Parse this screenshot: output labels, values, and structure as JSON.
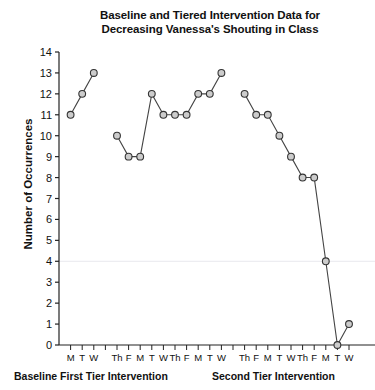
{
  "chart_data": {
    "type": "line",
    "title": "Baseline and Tiered Intervention Data for Decreasing Vanessa's Shouting in Class",
    "title_line1": "Baseline and Tiered Intervention Data for",
    "title_line2": "Decreasing Vanessa's Shouting in Class",
    "xlabel": "",
    "ylabel": "Number of Occurrences",
    "ylim": [
      0,
      14
    ],
    "ytick_labels": [
      "0",
      "1",
      "2",
      "3",
      "4",
      "5",
      "6",
      "7",
      "8",
      "9",
      "10",
      "11",
      "12",
      "13",
      "14"
    ],
    "ytick_values": [
      0,
      1,
      2,
      3,
      4,
      5,
      6,
      7,
      8,
      9,
      10,
      11,
      12,
      13,
      14
    ],
    "grid": false,
    "gridline_values": [
      4
    ],
    "legend": "none",
    "marker": "open-circle",
    "xtick_labels": [
      "M",
      "T",
      "W",
      "Th",
      "F",
      "M",
      "T",
      "W",
      "Th",
      "F",
      "M",
      "T",
      "W",
      "Th",
      "F",
      "M",
      "T",
      "W",
      "Th",
      "F",
      "M",
      "T",
      "W",
      "Th",
      "F"
    ],
    "phases": [
      {
        "name": "Baseline",
        "label": "Baseline",
        "points": [
          {
            "x": "M",
            "y": 11
          },
          {
            "x": "T",
            "y": 12
          },
          {
            "x": "W",
            "y": 13
          }
        ]
      },
      {
        "name": "First Tier Intervention",
        "label": "First Tier Intervention",
        "points": [
          {
            "x": "Th",
            "y": 10
          },
          {
            "x": "F",
            "y": 9
          },
          {
            "x": "M",
            "y": 9
          },
          {
            "x": "T",
            "y": 12
          },
          {
            "x": "W",
            "y": 11
          },
          {
            "x": "Th",
            "y": 11
          },
          {
            "x": "F",
            "y": 11
          },
          {
            "x": "M",
            "y": 12
          },
          {
            "x": "T",
            "y": 12
          },
          {
            "x": "W",
            "y": 13
          }
        ]
      },
      {
        "name": "Second Tier Intervention",
        "label": "Second Tier Intervention",
        "points": [
          {
            "x": "Th",
            "y": 12
          },
          {
            "x": "F",
            "y": 11
          },
          {
            "x": "M",
            "y": 11
          },
          {
            "x": "T",
            "y": 10
          },
          {
            "x": "W",
            "y": 9
          },
          {
            "x": "Th",
            "y": 8
          },
          {
            "x": "F",
            "y": 8
          },
          {
            "x": "M",
            "y": 4
          },
          {
            "x": "T",
            "y": 0
          },
          {
            "x": "W",
            "y": 1
          }
        ]
      }
    ],
    "phase_label_a": "Baseline First Tier Intervention",
    "phase_label_b": "Second Tier Intervention",
    "series_all_values": [
      11,
      12,
      13,
      10,
      9,
      9,
      12,
      11,
      11,
      11,
      12,
      12,
      13,
      12,
      11,
      11,
      10,
      9,
      8,
      8,
      4,
      0,
      1
    ],
    "colors": {
      "line": "#444444",
      "marker_fill": "#cccccc",
      "marker_stroke": "#333333",
      "axis": "#222222",
      "gridline": "#e9e9ee",
      "text": "#111111"
    }
  }
}
